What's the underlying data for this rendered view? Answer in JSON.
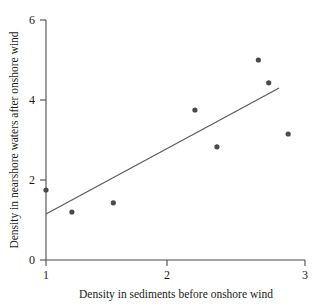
{
  "chart_data": {
    "type": "scatter",
    "title": "",
    "xlabel": "Density in sediments before onshore wind",
    "ylabel": "Density in nearshore waters after onshore wind",
    "xlim": [
      1,
      3
    ],
    "ylim": [
      0,
      6
    ],
    "xticks": [
      1,
      2,
      3
    ],
    "yticks": [
      0,
      2,
      4,
      6
    ],
    "xtick_labels": [
      "1",
      "2",
      "3"
    ],
    "ytick_labels": [
      "0",
      "2",
      "4",
      "6"
    ],
    "grid": false,
    "legend": false,
    "legend_position": "none",
    "marker_color": "#4a4a4a",
    "line_color": "#5a5a5a",
    "points": [
      {
        "x": 1.0,
        "y": 1.75
      },
      {
        "x": 1.2,
        "y": 1.2
      },
      {
        "x": 1.52,
        "y": 1.43
      },
      {
        "x": 2.15,
        "y": 3.75
      },
      {
        "x": 2.32,
        "y": 2.83
      },
      {
        "x": 2.64,
        "y": 5.0
      },
      {
        "x": 2.72,
        "y": 4.43
      },
      {
        "x": 2.87,
        "y": 3.15
      }
    ],
    "series": [
      {
        "name": "observations",
        "x": [
          1.0,
          1.2,
          1.52,
          2.15,
          2.32,
          2.64,
          2.72,
          2.87
        ],
        "values": [
          1.75,
          1.2,
          1.43,
          3.75,
          2.83,
          5.0,
          4.43,
          3.15
        ]
      }
    ],
    "trendline": {
      "type": "linear-fit",
      "x_start": 1.0,
      "y_start": 1.15,
      "x_end": 2.8,
      "y_end": 4.3
    },
    "annotations": []
  },
  "axes": {
    "x_title": "Density in sediments before onshore wind",
    "y_title": "Density in nearshore waters after onshore wind",
    "x_tick_0": "1",
    "x_tick_1": "2",
    "x_tick_2": "3",
    "y_tick_0": "0",
    "y_tick_1": "2",
    "y_tick_2": "4",
    "y_tick_3": "6"
  }
}
